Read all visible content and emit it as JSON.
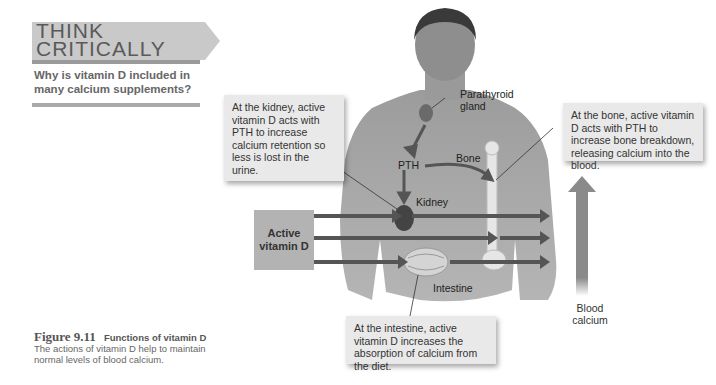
{
  "think_critically": {
    "title_line1": "THINK",
    "title_line2": "CRITICALLY",
    "question": "Why is vitamin D included in many calcium supplements?"
  },
  "figure_caption": {
    "number": "Figure 9.11",
    "title": "Functions of vitamin D",
    "text": "The actions of vitamin D help to maintain normal levels of blood calcium."
  },
  "labels": {
    "parathyroid": "Parathyroid gland",
    "pth": "PTH",
    "bone": "Bone",
    "kidney": "Kidney",
    "intestine": "Intestine",
    "active_vitamin_d_line1": "Active",
    "active_vitamin_d_line2": "vitamin D",
    "blood_calcium_line1": "Blood",
    "blood_calcium_line2": "calcium"
  },
  "callouts": {
    "kidney": "At the kidney, active vitamin D acts with PTH to increase calcium retention so less is lost in the urine.",
    "bone": "At the bone, active vitamin D acts with PTH to increase bone breakdown, releasing calcium into the blood.",
    "intestine": "At the intestine, active vitamin D increases the absorption of calcium from the diet."
  },
  "colors": {
    "arrow": "#555555",
    "box": "#b3b3b3",
    "callout_bg": "#e9e9e9"
  }
}
